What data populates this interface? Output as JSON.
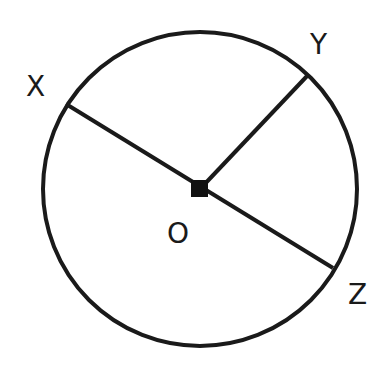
{
  "diagram": {
    "type": "circle-geometry",
    "circle": {
      "cx": 200,
      "cy": 189,
      "r": 157,
      "stroke": "#1a1a1a"
    },
    "center": {
      "label": "O",
      "x": 200,
      "y": 189
    },
    "points": [
      {
        "id": "X",
        "label": "X",
        "x": 66,
        "y": 104,
        "label_x": 26,
        "label_y": 96
      },
      {
        "id": "Y",
        "label": "Y",
        "x": 308,
        "y": 75,
        "label_x": 310,
        "label_y": 54
      },
      {
        "id": "Z",
        "label": "Z",
        "x": 333,
        "y": 268,
        "label_x": 348,
        "label_y": 304
      }
    ],
    "center_label_pos": {
      "x": 167,
      "y": 243
    },
    "segments": [
      {
        "name": "diameter-XZ",
        "from": "X",
        "to": "Z"
      },
      {
        "name": "radius-OY",
        "from": "O",
        "to": "Y"
      }
    ]
  }
}
